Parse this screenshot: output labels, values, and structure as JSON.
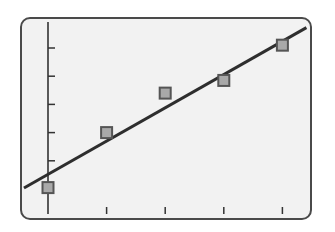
{
  "chart_data": {
    "type": "scatter",
    "title": "",
    "xlabel": "",
    "ylabel": "",
    "x": [
      0,
      1,
      2,
      3,
      4
    ],
    "series": [
      {
        "name": "data points",
        "kind": "scatter",
        "marker": "square",
        "x": [
          0,
          1,
          2,
          3,
          4
        ],
        "y": [
          0.05,
          2.0,
          3.4,
          3.85,
          5.1
        ]
      },
      {
        "name": "best-fit line",
        "kind": "line",
        "slope": 1.18,
        "intercept": 0.52,
        "x_range": [
          -0.41,
          4.41
        ]
      }
    ],
    "xticks": [
      1,
      2,
      3,
      4
    ],
    "yticks": [
      1,
      2,
      3,
      4,
      5
    ],
    "xtick_labels": [],
    "ytick_labels": [],
    "xlim": [
      -0.46,
      4.5
    ],
    "ylim": [
      -1.1,
      6.0
    ],
    "grid": false,
    "legend": null
  },
  "style": {
    "frame_fill": "#f2f2f2",
    "frame_stroke": "#4a4a4a",
    "axis_color": "#333333",
    "line_color": "#2e2e2e",
    "marker_fill": "#a9a9a9",
    "marker_stroke": "#555555"
  },
  "layout": {
    "frame": {
      "x": 21,
      "y": 18,
      "w": 290,
      "h": 201,
      "r": 9
    },
    "origin_px": {
      "x": 48,
      "y": 189
    },
    "x_unit_px": 58.6,
    "y_unit_px": 28.2,
    "y_axis_top": 22,
    "y_axis_bottom": 214,
    "x_tick_top": 207,
    "x_tick_bottom": 214,
    "y_tick_len": 7,
    "marker_size": 11
  }
}
